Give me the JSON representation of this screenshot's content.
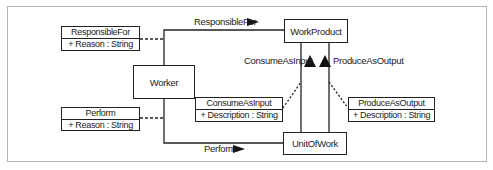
{
  "diagram": {
    "type": "UML class diagram",
    "classes": {
      "worker": "Worker",
      "work_product": "WorkProduct",
      "unit_of_work": "UnitOfWork"
    },
    "association_classes": {
      "responsible_for": {
        "name": "ResponsibleFor",
        "attribute": "+ Reason : String"
      },
      "perform": {
        "name": "Perform",
        "attribute": "+ Reason : String"
      },
      "consume_as_input": {
        "name": "ConsumeAsInput",
        "attribute": "+ Description : String"
      },
      "produce_as_output": {
        "name": "ProduceAsOutput",
        "attribute": "+ Description : String"
      }
    },
    "associations": {
      "responsible_for_label": "ResponsibleFor",
      "perform_label": "Perform",
      "consume_as_input_label": "ConsumeAsInput",
      "produce_as_output_label": "ProduceAsOutput"
    },
    "colors": {
      "line": "#222222",
      "frame": "#b5b5b5",
      "background": "#ffffff"
    }
  }
}
